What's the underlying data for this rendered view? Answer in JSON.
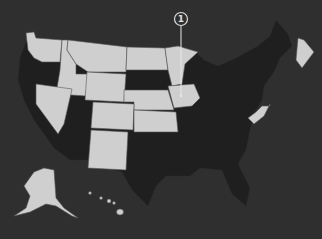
{
  "map": {
    "title": "United States",
    "background_color": "#2f2f2f",
    "highlight_color": "#cfcfcf",
    "base_color": "#1f1f1f",
    "highlighted_states": [
      "Washington",
      "Idaho",
      "Montana",
      "Wyoming",
      "Nevada",
      "Colorado",
      "New Mexico",
      "North Dakota",
      "Nebraska",
      "Kansas",
      "Minnesota",
      "Iowa",
      "Maine",
      "West Virginia",
      "Alaska",
      "Hawaii"
    ],
    "marker": {
      "label": "1",
      "state": "Iowa"
    }
  }
}
